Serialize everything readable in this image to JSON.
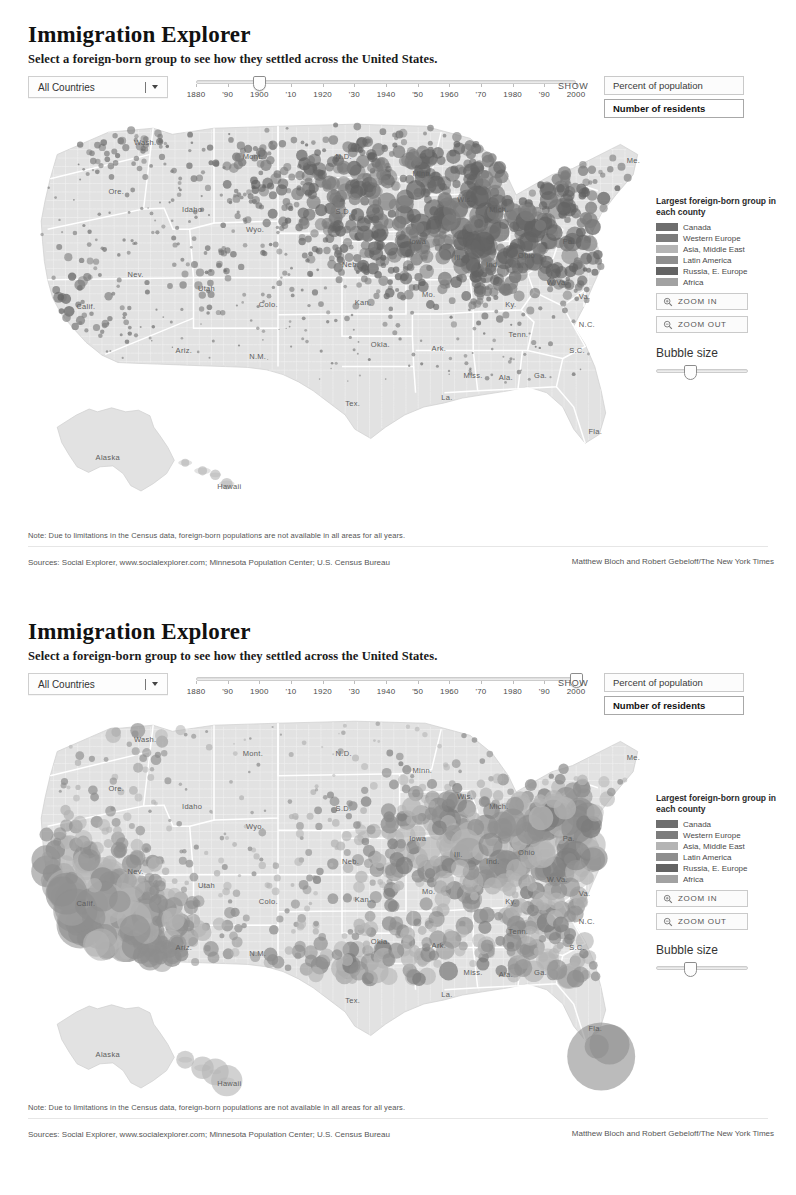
{
  "meta": {
    "accent_land": "#e2e2e2",
    "accent_border": "#ffffff",
    "bubble_color": "#8a8a8a"
  },
  "panels": [
    {
      "id": "panel-1900",
      "title": "Immigration Explorer",
      "subtitle": "Select a foreign-born group to see how they settled across the United States.",
      "select": {
        "value": "All Countries",
        "options": [
          "All Countries"
        ]
      },
      "timeline": {
        "labels": [
          "1880",
          "'90",
          "1900",
          "'10",
          "1920",
          "'30",
          "1940",
          "'50",
          "1960",
          "'70",
          "1980",
          "'90",
          "2000"
        ],
        "min_year": 1880,
        "max_year": 2000,
        "value": 1900
      },
      "show": {
        "label": "SHOW",
        "options": [
          {
            "label": "Percent of population",
            "selected": false
          },
          {
            "label": "Number of residents",
            "selected": true
          }
        ]
      },
      "legend": {
        "title": "Largest foreign-born group in each county",
        "items": [
          {
            "label": "Canada",
            "color": "#6e6e6e"
          },
          {
            "label": "Western Europe",
            "color": "#7c7c7c"
          },
          {
            "label": "Asia, Middle East",
            "color": "#b4b4b4"
          },
          {
            "label": "Latin America",
            "color": "#8e8e8e"
          },
          {
            "label": "Russia, E. Europe",
            "color": "#636363"
          },
          {
            "label": "Africa",
            "color": "#a2a2a2"
          }
        ]
      },
      "controls": {
        "zoom_in": "ZOOM IN",
        "zoom_out": "ZOOM OUT",
        "bubble_size_label": "Bubble size",
        "bubble_size_value": 38
      },
      "note": "Note: Due to limitations in the Census data, foreign-born  populations are not available in all areas for all years.",
      "sources": "Sources: Social Explorer, www.socialexplorer.com; Minnesota Population Center; U.S. Census Bureau",
      "credit": "Matthew Bloch and Robert Gebeloff/The New York Times"
    },
    {
      "id": "panel-2000",
      "title": "Immigration Explorer",
      "subtitle": "Select a foreign-born group to see how they settled across the United States.",
      "select": {
        "value": "All Countries",
        "options": [
          "All Countries"
        ]
      },
      "timeline": {
        "labels": [
          "1880",
          "'90",
          "1900",
          "'10",
          "1920",
          "'30",
          "1940",
          "'50",
          "1960",
          "'70",
          "1980",
          "'90",
          "2000"
        ],
        "min_year": 1880,
        "max_year": 2000,
        "value": 2000
      },
      "show": {
        "label": "SHOW",
        "options": [
          {
            "label": "Percent of population",
            "selected": false
          },
          {
            "label": "Number of residents",
            "selected": true
          }
        ]
      },
      "legend": {
        "title": "Largest foreign-born group in each county",
        "items": [
          {
            "label": "Canada",
            "color": "#6e6e6e"
          },
          {
            "label": "Western Europe",
            "color": "#7c7c7c"
          },
          {
            "label": "Asia, Middle East",
            "color": "#b4b4b4"
          },
          {
            "label": "Latin America",
            "color": "#8e8e8e"
          },
          {
            "label": "Russia, E. Europe",
            "color": "#636363"
          },
          {
            "label": "Africa",
            "color": "#a2a2a2"
          }
        ]
      },
      "controls": {
        "zoom_in": "ZOOM IN",
        "zoom_out": "ZOOM OUT",
        "bubble_size_label": "Bubble size",
        "bubble_size_value": 38
      },
      "note": "Note: Due to limitations in the Census data, foreign-born  populations are not available in all areas for all years.",
      "sources": "Sources: Social Explorer, www.socialexplorer.com; Minnesota Population Center; U.S. Census Bureau",
      "credit": "Matthew Bloch and Robert Gebeloff/The New York Times"
    }
  ],
  "state_labels": [
    {
      "name": "Wash.",
      "x": 0.175,
      "y": 0.075
    },
    {
      "name": "Ore.",
      "x": 0.135,
      "y": 0.195
    },
    {
      "name": "Idaho",
      "x": 0.25,
      "y": 0.24
    },
    {
      "name": "Mont.",
      "x": 0.345,
      "y": 0.11
    },
    {
      "name": "Wyo.",
      "x": 0.35,
      "y": 0.29
    },
    {
      "name": "Nev.",
      "x": 0.165,
      "y": 0.4
    },
    {
      "name": "Utah",
      "x": 0.275,
      "y": 0.435
    },
    {
      "name": "Calif.",
      "x": 0.085,
      "y": 0.48
    },
    {
      "name": "Colo.",
      "x": 0.37,
      "y": 0.475
    },
    {
      "name": "Ariz.",
      "x": 0.24,
      "y": 0.59
    },
    {
      "name": "N.M.",
      "x": 0.355,
      "y": 0.605
    },
    {
      "name": "N.D.",
      "x": 0.49,
      "y": 0.11
    },
    {
      "name": "S.D.",
      "x": 0.49,
      "y": 0.245
    },
    {
      "name": "Neb.",
      "x": 0.5,
      "y": 0.375
    },
    {
      "name": "Kan.",
      "x": 0.52,
      "y": 0.47
    },
    {
      "name": "Okla.",
      "x": 0.545,
      "y": 0.575
    },
    {
      "name": "Tex.",
      "x": 0.505,
      "y": 0.72
    },
    {
      "name": "Minn.",
      "x": 0.61,
      "y": 0.15
    },
    {
      "name": "Iowa",
      "x": 0.605,
      "y": 0.32
    },
    {
      "name": "Mo.",
      "x": 0.625,
      "y": 0.45
    },
    {
      "name": "Ark.",
      "x": 0.64,
      "y": 0.585
    },
    {
      "name": "La.",
      "x": 0.655,
      "y": 0.705
    },
    {
      "name": "Wis.",
      "x": 0.68,
      "y": 0.215
    },
    {
      "name": "Ill.",
      "x": 0.675,
      "y": 0.36
    },
    {
      "name": "Mich.",
      "x": 0.73,
      "y": 0.24
    },
    {
      "name": "Ind.",
      "x": 0.725,
      "y": 0.375
    },
    {
      "name": "Ohio",
      "x": 0.775,
      "y": 0.355
    },
    {
      "name": "Ky.",
      "x": 0.755,
      "y": 0.475
    },
    {
      "name": "Tenn.",
      "x": 0.76,
      "y": 0.55
    },
    {
      "name": "Miss.",
      "x": 0.69,
      "y": 0.65
    },
    {
      "name": "Ala.",
      "x": 0.745,
      "y": 0.655
    },
    {
      "name": "Ga.",
      "x": 0.8,
      "y": 0.65
    },
    {
      "name": "Fla.",
      "x": 0.885,
      "y": 0.79
    },
    {
      "name": "S.C.",
      "x": 0.855,
      "y": 0.59
    },
    {
      "name": "N.C.",
      "x": 0.87,
      "y": 0.525
    },
    {
      "name": "Va.",
      "x": 0.87,
      "y": 0.455
    },
    {
      "name": "W.Va.",
      "x": 0.82,
      "y": 0.42
    },
    {
      "name": "Pa.",
      "x": 0.845,
      "y": 0.32
    },
    {
      "name": "Me.",
      "x": 0.945,
      "y": 0.12
    },
    {
      "name": "Alaska",
      "x": 0.115,
      "y": 0.855
    },
    {
      "name": "Hawaii",
      "x": 0.305,
      "y": 0.925
    }
  ],
  "chart_data": {
    "type": "map",
    "title": "Immigration Explorer",
    "legend_title": "Largest foreign-born group in each county",
    "legend_categories": [
      "Canada",
      "Western Europe",
      "Asia, Middle East",
      "Latin America",
      "Russia, E. Europe",
      "Africa"
    ],
    "measure": "Number of residents",
    "frames": [
      {
        "year": 1900,
        "label": "1900",
        "panel": "panel-1900"
      },
      {
        "year": 2000,
        "label": "2000",
        "panel": "panel-2000"
      }
    ],
    "axis_ticks": [
      "1880",
      "'90",
      "1900",
      "'10",
      "1920",
      "'30",
      "1940",
      "'50",
      "1960",
      "'70",
      "1980",
      "'90",
      "2000"
    ]
  }
}
